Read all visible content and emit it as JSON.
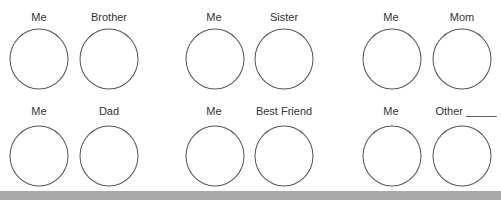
{
  "pairs": [
    {
      "left": "Me",
      "right": "Brother"
    },
    {
      "left": "Me",
      "right": "Sister"
    },
    {
      "left": "Me",
      "right": "Mom"
    },
    {
      "left": "Me",
      "right": "Dad"
    },
    {
      "left": "Me",
      "right": "Best Friend"
    },
    {
      "left": "Me",
      "right": "Other _____"
    }
  ]
}
